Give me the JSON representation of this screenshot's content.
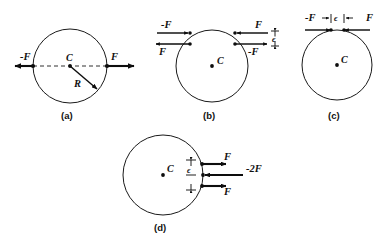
{
  "figure": {
    "background_color": "#ffffff",
    "line_color": "#0d0d0d",
    "panels": [
      {
        "id": "a",
        "tag": "(a)",
        "center_label": "C",
        "radius_label": "R",
        "forces": [
          {
            "label": "-F",
            "direction": "left",
            "position": "left-edge"
          },
          {
            "label": "F",
            "direction": "right",
            "position": "right-edge"
          }
        ],
        "has_dashed_diameter": true,
        "has_radius_arrow": true,
        "epsilon_label": null
      },
      {
        "id": "b",
        "tag": "(b)",
        "center_label": "C",
        "radius_label": null,
        "forces": [
          {
            "label": "-F",
            "direction": "right",
            "position": "upper-left"
          },
          {
            "label": "F",
            "direction": "left",
            "position": "lower-left"
          },
          {
            "label": "F",
            "direction": "left",
            "position": "upper-right"
          },
          {
            "label": "-F",
            "direction": "right",
            "position": "lower-right"
          }
        ],
        "has_dashed_diameter": false,
        "has_radius_arrow": false,
        "epsilon_label": "ϵ"
      },
      {
        "id": "c",
        "tag": "(c)",
        "center_label": "C",
        "radius_label": null,
        "forces": [
          {
            "label": "-F",
            "direction": "right",
            "position": "top-left"
          },
          {
            "label": "F",
            "direction": "left",
            "position": "top-right"
          }
        ],
        "has_dashed_diameter": false,
        "has_radius_arrow": false,
        "epsilon_label": "ϵ"
      },
      {
        "id": "d",
        "tag": "(d)",
        "center_label": "C",
        "radius_label": null,
        "forces": [
          {
            "label": "F",
            "direction": "right",
            "position": "upper-right"
          },
          {
            "label": "-2F",
            "direction": "left",
            "position": "middle-right"
          },
          {
            "label": "F",
            "direction": "right",
            "position": "lower-right"
          }
        ],
        "has_dashed_diameter": false,
        "has_radius_arrow": false,
        "epsilon_label": "ϵ"
      }
    ]
  }
}
